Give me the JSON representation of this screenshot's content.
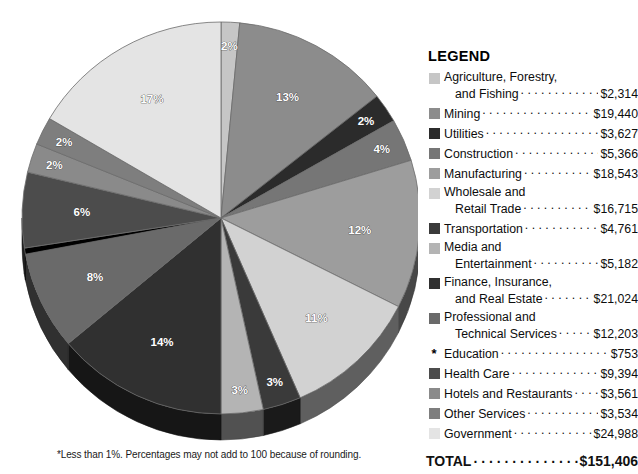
{
  "chart_data": {
    "type": "pie",
    "title": "",
    "unit": "millions of dollars",
    "footnote": "*Less than 1%. Percentages may not add to 100 because of rounding.",
    "total_label": "TOTAL",
    "total_value": "$151,406",
    "legend_title": "LEGEND",
    "categories": [
      "Agriculture, Forestry, and Fishing",
      "Mining",
      "Utilities",
      "Construction",
      "Manufacturing",
      "Wholesale and Retail Trade",
      "Transportation",
      "Media and Entertainment",
      "Finance, Insurance, and Real Estate",
      "Professional and Technical Services",
      "Education",
      "Health Care",
      "Hotels and Restaurants",
      "Other Services",
      "Government"
    ],
    "values": [
      2314,
      19440,
      3627,
      5366,
      18543,
      16715,
      4761,
      5182,
      21024,
      12203,
      753,
      9394,
      3561,
      3534,
      24988
    ],
    "percent_labels": [
      "2%",
      "13%",
      "2%",
      "4%",
      "12%",
      "11%",
      "3%",
      "3%",
      "14%",
      "8%",
      "*",
      "6%",
      "2%",
      "2%",
      "17%"
    ],
    "colors": [
      "#c6c6c6",
      "#8c8c8c",
      "#2b2b2b",
      "#767676",
      "#9d9d9d",
      "#d2d2d2",
      "#3a3a3a",
      "#b4b4b4",
      "#303030",
      "#6a6a6a",
      "#000000",
      "#4c4c4c",
      "#8a8a8a",
      "#7e7e7e",
      "#e4e4e4"
    ],
    "legend_position": "right",
    "grid": false
  },
  "legend": {
    "title": "LEGEND",
    "items": [
      {
        "line1": "Agriculture, Forestry,",
        "line2": "and Fishing",
        "amount": "$2,314",
        "swatch": "#c6c6c6",
        "marker": "swatch"
      },
      {
        "line1": "Mining",
        "line2": "",
        "amount": "$19,440",
        "swatch": "#8c8c8c",
        "marker": "swatch"
      },
      {
        "line1": "Utilities",
        "line2": "",
        "amount": "$3,627",
        "swatch": "#2b2b2b",
        "marker": "swatch"
      },
      {
        "line1": "Construction",
        "line2": "",
        "amount": "$5,366",
        "swatch": "#767676",
        "marker": "swatch"
      },
      {
        "line1": "Manufacturing",
        "line2": "",
        "amount": "$18,543",
        "swatch": "#9d9d9d",
        "marker": "swatch"
      },
      {
        "line1": "Wholesale and",
        "line2": "Retail Trade",
        "amount": "$16,715",
        "swatch": "#d2d2d2",
        "marker": "swatch"
      },
      {
        "line1": "Transportation",
        "line2": "",
        "amount": "$4,761",
        "swatch": "#3a3a3a",
        "marker": "swatch"
      },
      {
        "line1": "Media and",
        "line2": "Entertainment",
        "amount": "$5,182",
        "swatch": "#b4b4b4",
        "marker": "swatch"
      },
      {
        "line1": "Finance, Insurance,",
        "line2": "and Real Estate",
        "amount": "$21,024",
        "swatch": "#303030",
        "marker": "swatch"
      },
      {
        "line1": "Professional and",
        "line2": "Technical Services",
        "amount": "$12,203",
        "swatch": "#6a6a6a",
        "marker": "swatch"
      },
      {
        "line1": "Education",
        "line2": "",
        "amount": "$753",
        "swatch": "#000000",
        "marker": "asterisk",
        "asterisk": "*"
      },
      {
        "line1": "Health Care",
        "line2": "",
        "amount": "$9,394",
        "swatch": "#4c4c4c",
        "marker": "swatch"
      },
      {
        "line1": "Hotels and Restaurants",
        "line2": "",
        "amount": "$3,561",
        "swatch": "#8a8a8a",
        "marker": "swatch"
      },
      {
        "line1": "Other Services",
        "line2": "",
        "amount": "$3,534",
        "swatch": "#7e7e7e",
        "marker": "swatch"
      },
      {
        "line1": "Government",
        "line2": "",
        "amount": "$24,988",
        "swatch": "#e4e4e4",
        "marker": "swatch"
      }
    ],
    "total_label": "TOTAL",
    "total_amount": "$151,406"
  },
  "pie": {
    "footnote": "*Less than 1%. Percentages may not add to 100 because of rounding.",
    "slices": [
      {
        "name": "Agriculture, Forestry, and Fishing",
        "percent": 1.5,
        "label": "2%",
        "color": "#c6c6c6",
        "show_label": true
      },
      {
        "name": "Mining",
        "percent": 12.8,
        "label": "13%",
        "color": "#8c8c8c",
        "show_label": true
      },
      {
        "name": "Utilities",
        "percent": 2.4,
        "label": "2%",
        "color": "#2b2b2b",
        "show_label": true
      },
      {
        "name": "Construction",
        "percent": 3.5,
        "label": "4%",
        "color": "#767676",
        "show_label": true
      },
      {
        "name": "Manufacturing",
        "percent": 12.2,
        "label": "12%",
        "color": "#9d9d9d",
        "show_label": true
      },
      {
        "name": "Wholesale and Retail Trade",
        "percent": 11.0,
        "label": "11%",
        "color": "#d2d2d2",
        "show_label": true
      },
      {
        "name": "Transportation",
        "percent": 3.1,
        "label": "3%",
        "color": "#3a3a3a",
        "show_label": true
      },
      {
        "name": "Media and Entertainment",
        "percent": 3.4,
        "label": "3%",
        "color": "#b4b4b4",
        "show_label": true
      },
      {
        "name": "Finance, Insurance, and Real Estate",
        "percent": 13.9,
        "label": "14%",
        "color": "#303030",
        "show_label": true
      },
      {
        "name": "Professional and Technical Services",
        "percent": 8.1,
        "label": "8%",
        "color": "#6a6a6a",
        "show_label": true
      },
      {
        "name": "Education",
        "percent": 0.5,
        "label": "",
        "color": "#000000",
        "show_label": false
      },
      {
        "name": "Health Care",
        "percent": 6.2,
        "label": "6%",
        "color": "#4c4c4c",
        "show_label": true
      },
      {
        "name": "Hotels and Restaurants",
        "percent": 2.4,
        "label": "2%",
        "color": "#8a8a8a",
        "show_label": true
      },
      {
        "name": "Other Services",
        "percent": 2.3,
        "label": "2%",
        "color": "#7e7e7e",
        "show_label": true
      },
      {
        "name": "Government",
        "percent": 16.5,
        "label": "17%",
        "color": "#e4e4e4",
        "show_label": true
      }
    ]
  }
}
